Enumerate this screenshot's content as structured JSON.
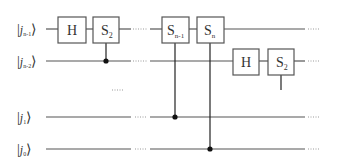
{
  "diagram": {
    "type": "quantum-circuit",
    "qubits": [
      {
        "ket_open": "|",
        "name": "j",
        "sub": "n-1",
        "ket_close": "⟩",
        "y": 29
      },
      {
        "ket_open": "|",
        "name": "j",
        "sub": "n-2",
        "ket_close": "⟩",
        "y": 61
      },
      {
        "ket_open": "|",
        "name": "j",
        "sub": "1",
        "ket_close": "⟩",
        "y": 117
      },
      {
        "ket_open": "|",
        "name": "j",
        "sub": "0",
        "ket_close": "⟩",
        "y": 149
      }
    ],
    "gates": [
      {
        "id": "h1",
        "label": "H",
        "sub": "",
        "wire": 0
      },
      {
        "id": "s2a",
        "label": "S",
        "sub": "2",
        "wire": 0,
        "control_wire": 1
      },
      {
        "id": "sn1",
        "label": "S",
        "sub": "n-1",
        "wire": 0,
        "control_wire": 2
      },
      {
        "id": "sn",
        "label": "S",
        "sub": "n",
        "wire": 0,
        "control_wire": 3
      },
      {
        "id": "h2",
        "label": "H",
        "sub": "",
        "wire": 1
      },
      {
        "id": "s2b",
        "label": "S",
        "sub": "2",
        "wire": 1,
        "control_wire": "continued"
      }
    ],
    "ellipsis_mid": "......",
    "ellipsis_wire": "......"
  }
}
